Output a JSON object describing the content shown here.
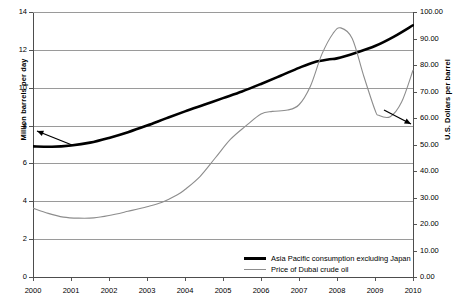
{
  "chart_data": {
    "type": "line",
    "title": "",
    "xlabel": "",
    "ylabel": "Million barrels per day",
    "y2label": "U.S. Dollars per barrel",
    "xlim": [
      2000,
      2010
    ],
    "ylim": [
      0,
      14
    ],
    "y2lim": [
      0,
      100
    ],
    "grid": true,
    "legend_position": "inside-bottom-right",
    "x_ticks": [
      "2000",
      "2001",
      "2002",
      "2003",
      "2004",
      "2005",
      "2006",
      "2007",
      "2008",
      "2009",
      "2010"
    ],
    "y_ticks_left": [
      "0",
      "2",
      "4",
      "6",
      "8",
      "10",
      "12",
      "14"
    ],
    "y_ticks_right": [
      "0.00",
      "10.00",
      "20.00",
      "30.00",
      "40.00",
      "50.00",
      "60.00",
      "70.00",
      "80.00",
      "90.00",
      "100.00"
    ],
    "series": [
      {
        "name": "Asia Pacific consumption excluding Japan",
        "axis": "left",
        "color": "#000000",
        "width": 2.6,
        "x": [
          2000,
          2000.5,
          2001,
          2001.5,
          2002,
          2002.5,
          2003,
          2003.5,
          2004,
          2004.5,
          2005,
          2005.5,
          2006,
          2006.5,
          2007,
          2007.4,
          2007.8,
          2008,
          2008.5,
          2009,
          2009.5,
          2010
        ],
        "values": [
          6.9,
          6.88,
          6.95,
          7.1,
          7.35,
          7.65,
          8.0,
          8.38,
          8.75,
          9.1,
          9.45,
          9.8,
          10.2,
          10.62,
          11.05,
          11.35,
          11.5,
          11.55,
          11.85,
          12.2,
          12.7,
          13.3
        ]
      },
      {
        "name": "Price of Dubai crude oil",
        "axis": "right",
        "color": "#8d8d8d",
        "width": 1.1,
        "x": [
          2000,
          2000.4,
          2000.8,
          2001.2,
          2001.6,
          2002,
          2002.5,
          2003,
          2003.4,
          2003.8,
          2004,
          2004.4,
          2004.8,
          2005.2,
          2005.6,
          2006,
          2006.3,
          2006.7,
          2007,
          2007.3,
          2007.6,
          2007.9,
          2008.1,
          2008.4,
          2008.7,
          2009,
          2009.1,
          2009.4,
          2009.7,
          2010
        ],
        "values": [
          26.0,
          24.0,
          22.6,
          22.2,
          22.3,
          23.2,
          24.8,
          26.5,
          28.2,
          31.0,
          33.0,
          38.0,
          45.0,
          52.0,
          57.0,
          61.5,
          62.5,
          63.0,
          65.0,
          72.0,
          84.0,
          92.0,
          94.0,
          90.0,
          76.0,
          63.0,
          61.0,
          60.5,
          66.0,
          78.0
        ]
      }
    ],
    "annotations": [
      {
        "name": "left-axis-arrow",
        "description": "arrow from black consumption line pointing to left axis"
      },
      {
        "name": "right-axis-arrow",
        "description": "arrow from gray price line pointing to right axis"
      }
    ]
  },
  "legend": {
    "entries": [
      {
        "label": "Asia Pacific consumption excluding Japan",
        "style": "thick-black"
      },
      {
        "label": "Price of Dubai crude oil",
        "style": "thin-gray"
      }
    ]
  }
}
